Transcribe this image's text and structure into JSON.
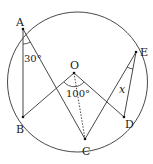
{
  "diagram": {
    "type": "circle-geometry",
    "circle": {
      "center_label": "O"
    },
    "points": {
      "A": "A",
      "B": "B",
      "C": "C",
      "D": "D",
      "E": "E",
      "O": "O"
    },
    "angles": {
      "BAC": "30°",
      "BOD": "100°",
      "CED": "x"
    },
    "segments": [
      "AB",
      "AC",
      "OB",
      "OD",
      "OC (dotted)",
      "EC",
      "ED"
    ]
  }
}
